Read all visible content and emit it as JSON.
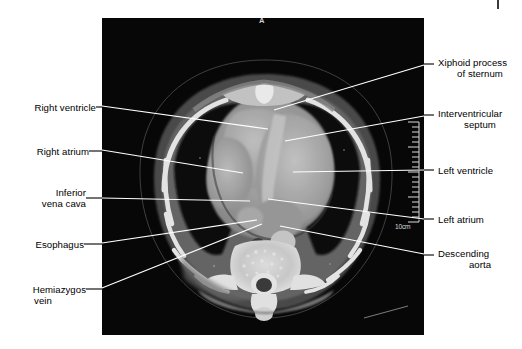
{
  "figure": {
    "kind": "axial-ct-thorax",
    "modality_note": "computed tomography axial section through the heart",
    "panel": {
      "x": 102,
      "y": 18,
      "width": 322,
      "height": 317,
      "background": "#0a0a0a"
    }
  },
  "image_overlay": {
    "orientation_marker": "A",
    "scale_label": "10cm",
    "ruler": {
      "ticks": 22,
      "position": "right-edge"
    }
  },
  "colors": {
    "page_background": "#ffffff",
    "label_text": "#000000",
    "leader_line": "#ffffff",
    "leader_line_outside": "#000000",
    "ct_background": "#0a0a0a",
    "soft_tissue": "#8d8d8d",
    "bone": "#f2f2f2",
    "fat": "#4a4a4a",
    "lung": "#101010"
  },
  "labels_left": [
    {
      "id": "right-ventricle",
      "lines": [
        "Right ventricle"
      ],
      "text_x": 19,
      "text_y": 102,
      "dash_x1": 96,
      "dash_y1": 107,
      "dash_x2": 110,
      "dash_y2": 107,
      "leader_x1": 110,
      "leader_y1": 107,
      "leader_x2": 268,
      "leader_y2": 129
    },
    {
      "id": "right-atrium",
      "lines": [
        "Right atrium"
      ],
      "text_x": 19,
      "text_y": 146,
      "dash_x1": 89,
      "dash_y1": 151,
      "dash_x2": 110,
      "dash_y2": 151,
      "leader_x1": 110,
      "leader_y1": 151,
      "leader_x2": 243,
      "leader_y2": 173
    },
    {
      "id": "inferior-vena-cava",
      "lines": [
        "Inferior",
        "vena cava"
      ],
      "text_x": 19,
      "text_y": 191,
      "dash_x1": 86,
      "dash_y1": 198,
      "dash_x2": 110,
      "dash_y2": 198,
      "leader_x1": 110,
      "leader_y1": 198,
      "leader_x2": 250,
      "leader_y2": 201
    },
    {
      "id": "esophagus",
      "lines": [
        "Esophagus"
      ],
      "text_x": 19,
      "text_y": 239,
      "dash_x1": 84,
      "dash_y1": 244,
      "dash_x2": 110,
      "dash_y2": 244,
      "leader_x1": 110,
      "leader_y1": 244,
      "leader_x2": 257,
      "leader_y2": 220
    },
    {
      "id": "hemiazygos-vein",
      "lines": [
        "Hemiazygos",
        "vein"
      ],
      "text_x": 19,
      "text_y": 284,
      "dash_x1": 86,
      "dash_y1": 289,
      "dash_x2": 110,
      "dash_y2": 289,
      "leader_x1": 110,
      "leader_y1": 289,
      "leader_x2": 262,
      "leader_y2": 224
    }
  ],
  "labels_right": [
    {
      "id": "xiphoid-process-of-sternum",
      "lines": [
        "Xiphoid process",
        "of sternum"
      ],
      "text_x": 438,
      "text_y": 57,
      "dash_x1": 414,
      "dash_y1": 64,
      "dash_x2": 434,
      "dash_y2": 64,
      "leader_x1": 414,
      "leader_y1": 64,
      "leader_x2": 274,
      "leader_y2": 110
    },
    {
      "id": "interventricular-septum",
      "lines": [
        "Interventricular",
        "septum"
      ],
      "text_x": 438,
      "text_y": 108,
      "dash_x1": 414,
      "dash_y1": 115,
      "dash_x2": 434,
      "dash_y2": 115,
      "leader_x1": 414,
      "leader_y1": 115,
      "leader_x2": 285,
      "leader_y2": 141
    },
    {
      "id": "left-ventricle",
      "lines": [
        "Left ventricle"
      ],
      "text_x": 438,
      "text_y": 165,
      "dash_x1": 414,
      "dash_y1": 170,
      "dash_x2": 434,
      "dash_y2": 170,
      "leader_x1": 414,
      "leader_y1": 170,
      "leader_x2": 293,
      "leader_y2": 172
    },
    {
      "id": "left-atrium",
      "lines": [
        "Left atrium"
      ],
      "text_x": 438,
      "text_y": 214,
      "dash_x1": 414,
      "dash_y1": 219,
      "dash_x2": 434,
      "dash_y2": 219,
      "leader_x1": 414,
      "leader_y1": 219,
      "leader_x2": 268,
      "leader_y2": 199
    },
    {
      "id": "descending-aorta",
      "lines": [
        "Descending",
        "aorta"
      ],
      "text_x": 438,
      "text_y": 248,
      "dash_x1": 414,
      "dash_y1": 255,
      "dash_x2": 434,
      "dash_y2": 255,
      "leader_x1": 414,
      "leader_y1": 255,
      "leader_x2": 280,
      "leader_y2": 226
    }
  ]
}
